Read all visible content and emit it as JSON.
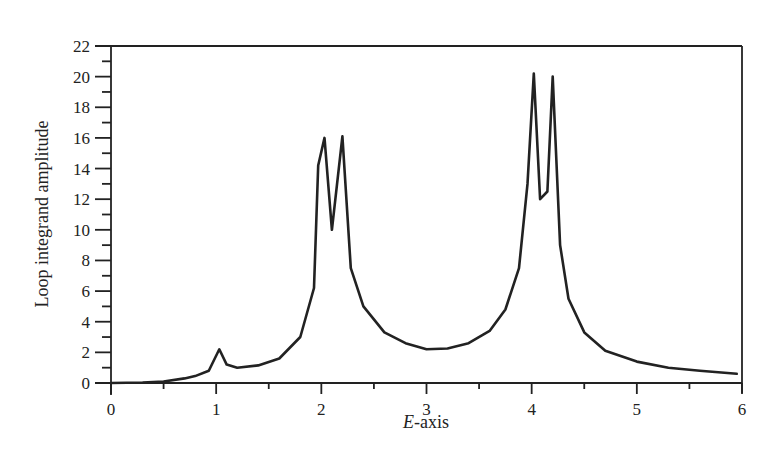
{
  "chart_data": {
    "type": "line",
    "title": "",
    "xlabel": "E-axis",
    "xlabel_italic_part": "E",
    "xlabel_rest": "-axis",
    "ylabel": "Loop integrand amplitude",
    "xlim": [
      0,
      6
    ],
    "ylim": [
      0,
      22
    ],
    "x_ticks": [
      0,
      1,
      2,
      3,
      4,
      5,
      6
    ],
    "x_minor_ticks": [
      0.5,
      1.5,
      2.5,
      3.5,
      4.5,
      5.5
    ],
    "y_ticks": [
      0,
      2,
      4,
      6,
      8,
      10,
      12,
      14,
      16,
      18,
      20,
      22
    ],
    "y_minor_ticks": [
      1,
      3,
      5,
      7,
      9,
      11,
      13,
      15,
      17,
      19,
      21
    ],
    "grid": false,
    "legend": null,
    "line_color": "#222222",
    "series": [
      {
        "name": "Loop integrand amplitude",
        "x": [
          0,
          0.3,
          0.5,
          0.7,
          0.8,
          0.93,
          1.03,
          1.1,
          1.2,
          1.4,
          1.6,
          1.8,
          1.93,
          1.97,
          2.03,
          2.1,
          2.2,
          2.28,
          2.4,
          2.6,
          2.8,
          3.0,
          3.2,
          3.4,
          3.6,
          3.75,
          3.88,
          3.96,
          4.02,
          4.08,
          4.15,
          4.2,
          4.27,
          4.35,
          4.5,
          4.7,
          5.0,
          5.3,
          5.6,
          5.95
        ],
        "y": [
          0,
          0.03,
          0.1,
          0.3,
          0.45,
          0.8,
          2.2,
          1.2,
          1.0,
          1.15,
          1.6,
          3.0,
          6.2,
          14.2,
          16.0,
          10.0,
          16.1,
          7.5,
          5.0,
          3.3,
          2.6,
          2.2,
          2.25,
          2.6,
          3.4,
          4.8,
          7.5,
          13.0,
          20.2,
          12.0,
          12.5,
          20.0,
          9.0,
          5.5,
          3.3,
          2.1,
          1.4,
          1.0,
          0.8,
          0.6
        ]
      }
    ]
  },
  "plot_box": {
    "left": 111,
    "right": 742,
    "top": 46,
    "bottom": 383
  }
}
